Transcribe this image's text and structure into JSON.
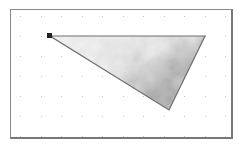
{
  "canvas": {
    "background": "#ffffff",
    "border_color": "#8a8a8a",
    "grid": {
      "type": "dots",
      "dot_color": "#c8c8c8",
      "spacing_x": 20.5,
      "spacing_y": 20,
      "offset_x": 9,
      "offset_y": 6
    }
  },
  "shape": {
    "type": "triangle",
    "selected": true,
    "vertices": [
      [
        39,
        26
      ],
      [
        194,
        26
      ],
      [
        158,
        100
      ]
    ],
    "stroke_color": "#6e6e6e",
    "fill": "grayscale-cloud-texture",
    "fill_colors": {
      "light": "#f2f2f2",
      "mid": "#c4c4c4",
      "dark": "#5a5a5a"
    },
    "selection_handle": {
      "position": [
        39,
        26
      ],
      "color": "#222222"
    }
  }
}
